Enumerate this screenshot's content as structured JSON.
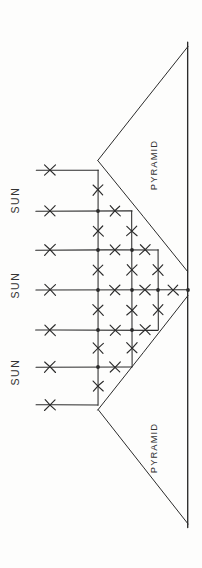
{
  "figure": {
    "background_color": "#fdfdfc",
    "ink_color": "#2b2b2b",
    "width": 202,
    "height": 568
  },
  "labels": {
    "sun": [
      {
        "text": "SUN",
        "x": 19,
        "y": 200,
        "rotation": -90
      },
      {
        "text": "SUN",
        "x": 19,
        "y": 285,
        "rotation": -90
      },
      {
        "text": "SUN",
        "x": 19,
        "y": 372,
        "rotation": -90
      }
    ],
    "pyramid": [
      {
        "text": "PYRAMID",
        "x": 157,
        "y": 165,
        "rotation": -90
      },
      {
        "text": "PYRAMID",
        "x": 157,
        "y": 448,
        "rotation": -90
      }
    ]
  },
  "baseline": {
    "name": "ground-baseline",
    "x": 188,
    "y_start": 42,
    "y_end": 528
  },
  "pyramids": [
    {
      "name": "upper-pyramid",
      "apex": {
        "x": 98,
        "y": 160
      },
      "base_top": {
        "x": 188,
        "y": 46
      },
      "base_bottom": {
        "x": 188,
        "y": 272
      }
    },
    {
      "name": "lower-pyramid",
      "apex": {
        "x": 98,
        "y": 410
      },
      "base_top": {
        "x": 188,
        "y": 296
      },
      "base_bottom": {
        "x": 188,
        "y": 524
      }
    }
  ],
  "sun_rays": {
    "description": "Seven horizontal sun rays entering from the left, each bearing an X tick mark",
    "x_start": 36,
    "x_mark": 50,
    "rays": [
      {
        "y": 170,
        "x_end": 98
      },
      {
        "y": 211,
        "x_end": 132
      },
      {
        "y": 250,
        "x_end": 158
      },
      {
        "y": 290,
        "x_end": 188
      },
      {
        "y": 330,
        "x_end": 158
      },
      {
        "y": 367,
        "x_end": 132
      },
      {
        "y": 405,
        "x_end": 98
      }
    ]
  },
  "lattice": {
    "description": "Rectangular construction grid between the two pyramid faces",
    "vertical_lines": [
      {
        "x": 98,
        "y_start": 170,
        "y_end": 405
      },
      {
        "x": 132,
        "y_start": 211,
        "y_end": 367
      },
      {
        "x": 158,
        "y_start": 250,
        "y_end": 330
      }
    ],
    "nodes": [
      {
        "x": 98,
        "y": 211
      },
      {
        "x": 98,
        "y": 250
      },
      {
        "x": 98,
        "y": 290
      },
      {
        "x": 98,
        "y": 330
      },
      {
        "x": 98,
        "y": 367
      },
      {
        "x": 132,
        "y": 250
      },
      {
        "x": 132,
        "y": 290
      },
      {
        "x": 132,
        "y": 330
      },
      {
        "x": 158,
        "y": 290
      },
      {
        "x": 188,
        "y": 290
      }
    ],
    "horizontal_x_marks": [
      {
        "x": 115,
        "y": 211
      },
      {
        "x": 115,
        "y": 250
      },
      {
        "x": 145,
        "y": 250
      },
      {
        "x": 115,
        "y": 290
      },
      {
        "x": 145,
        "y": 290
      },
      {
        "x": 173,
        "y": 290
      },
      {
        "x": 115,
        "y": 330
      },
      {
        "x": 145,
        "y": 330
      },
      {
        "x": 115,
        "y": 367
      }
    ],
    "vertical_x_marks": [
      {
        "x": 98,
        "y": 190
      },
      {
        "x": 98,
        "y": 231
      },
      {
        "x": 98,
        "y": 270
      },
      {
        "x": 98,
        "y": 310
      },
      {
        "x": 98,
        "y": 348
      },
      {
        "x": 98,
        "y": 386
      },
      {
        "x": 132,
        "y": 231
      },
      {
        "x": 132,
        "y": 270
      },
      {
        "x": 132,
        "y": 310
      },
      {
        "x": 132,
        "y": 348
      },
      {
        "x": 158,
        "y": 270
      },
      {
        "x": 158,
        "y": 310
      }
    ]
  }
}
